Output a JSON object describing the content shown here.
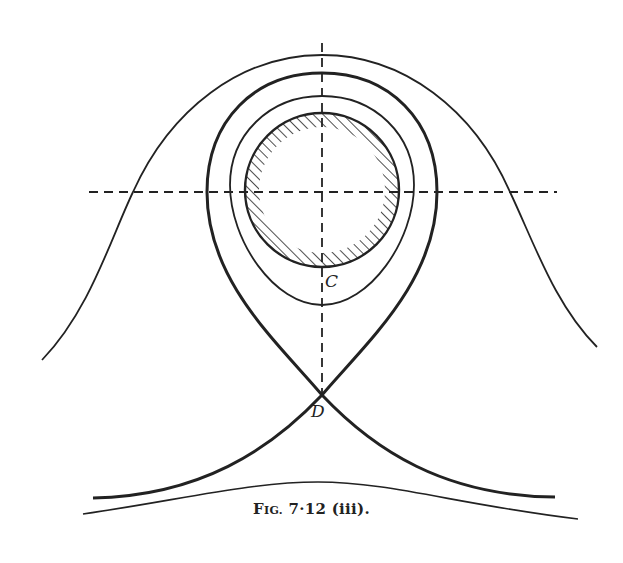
{
  "figure": {
    "caption_prefix": "F",
    "caption_smallcaps": "IG.",
    "caption_rest": " 7·12 (iii).",
    "caption_full": "Fig. 7·12 (iii).",
    "labels": {
      "C": "C",
      "D": "D"
    },
    "colors": {
      "ink": "#222222",
      "background": "#ffffff"
    },
    "elements": [
      {
        "name": "outer-bell-curve",
        "style": "thin"
      },
      {
        "name": "separatrix-teardrop",
        "style": "thick",
        "passes_through": "D"
      },
      {
        "name": "inner-closed-orbit",
        "style": "thin"
      },
      {
        "name": "hatched-circle",
        "style": "hatched ring",
        "center_marked_by": "dashed axes"
      },
      {
        "name": "vertical-dashed-axis",
        "style": "dashed"
      },
      {
        "name": "horizontal-dashed-axis",
        "style": "dashed"
      },
      {
        "name": "bottom-curve",
        "style": "thin"
      }
    ]
  }
}
